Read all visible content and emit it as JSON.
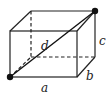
{
  "diagram": {
    "type": "rectangular-box",
    "labels": {
      "length": "a",
      "width": "b",
      "height": "c",
      "diagonal": "d"
    },
    "colors": {
      "stroke": "#222222",
      "dot": "#111111",
      "background": "#ffffff"
    }
  }
}
